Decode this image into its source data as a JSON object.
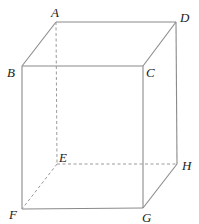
{
  "figure": {
    "type": "rectangular prism (cuboid) with hidden edges dashed",
    "stroke_color": "#8a8a8a",
    "vertices": {
      "A": {
        "label": "A",
        "x": 56,
        "y": 22
      },
      "B": {
        "label": "B",
        "x": 22,
        "y": 66
      },
      "C": {
        "label": "C",
        "x": 143,
        "y": 66
      },
      "D": {
        "label": "D",
        "x": 176,
        "y": 22
      },
      "E": {
        "label": "E",
        "x": 57,
        "y": 164
      },
      "F": {
        "label": "F",
        "x": 22,
        "y": 209
      },
      "G": {
        "label": "G",
        "x": 143,
        "y": 208
      },
      "H": {
        "label": "H",
        "x": 177,
        "y": 164
      }
    },
    "solid_edges": [
      "AB",
      "AD",
      "BC",
      "CD",
      "BF",
      "CG",
      "DH",
      "FG",
      "GH"
    ],
    "dashed_edges": [
      "AE",
      "EF",
      "EH"
    ]
  }
}
